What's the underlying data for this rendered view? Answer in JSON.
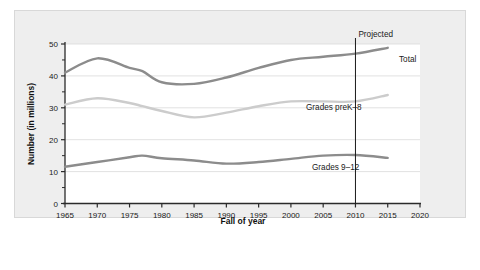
{
  "chart_data": {
    "type": "line",
    "title": "",
    "xlabel": "Fall of year",
    "ylabel": "Number (in millions)",
    "xlim": [
      1965,
      2020
    ],
    "ylim": [
      0,
      50
    ],
    "grid": true,
    "grid_axis": "y",
    "legend_position": "inline-labels",
    "x_ticks": [
      1965,
      1970,
      1975,
      1980,
      1985,
      1990,
      1995,
      2000,
      2005,
      2010,
      2015,
      2020
    ],
    "x_tick_labels": [
      "1965",
      "1970",
      "1975",
      "1980",
      "1985",
      "1990",
      "1995",
      "2000",
      "2005",
      "2010",
      "2015",
      "2020"
    ],
    "y_ticks": [
      0,
      10,
      20,
      30,
      40,
      50
    ],
    "y_tick_labels": [
      "0",
      "10",
      "20",
      "30",
      "40",
      "50"
    ],
    "y_minor_ticks": [
      5,
      15,
      25,
      35,
      45
    ],
    "x": [
      1965,
      1970,
      1975,
      1977,
      1980,
      1985,
      1990,
      1995,
      2000,
      2005,
      2010,
      2015
    ],
    "series": [
      {
        "name": "Total",
        "label": "Total",
        "color": "#8c8c8c",
        "values": [
          41.0,
          45.5,
          42.5,
          41.5,
          38.0,
          37.5,
          39.5,
          42.5,
          45.0,
          46.0,
          47.0,
          48.8
        ]
      },
      {
        "name": "Grades preK-8",
        "label": "Grades preK–8",
        "color": "#cccccc",
        "values": [
          31.0,
          33.0,
          31.5,
          30.5,
          29.0,
          27.0,
          28.5,
          30.5,
          32.0,
          32.0,
          32.0,
          34.0
        ]
      },
      {
        "name": "Grades 9-12",
        "label": "Grades 9–12",
        "color": "#8c8c8c",
        "values": [
          11.5,
          13.0,
          14.5,
          15.0,
          14.2,
          13.5,
          12.5,
          13.0,
          14.0,
          15.0,
          15.2,
          14.3
        ]
      }
    ],
    "annotations": [
      {
        "name": "projected-line",
        "label": "Projected",
        "x": 2010,
        "type": "vertical-rule"
      }
    ]
  }
}
